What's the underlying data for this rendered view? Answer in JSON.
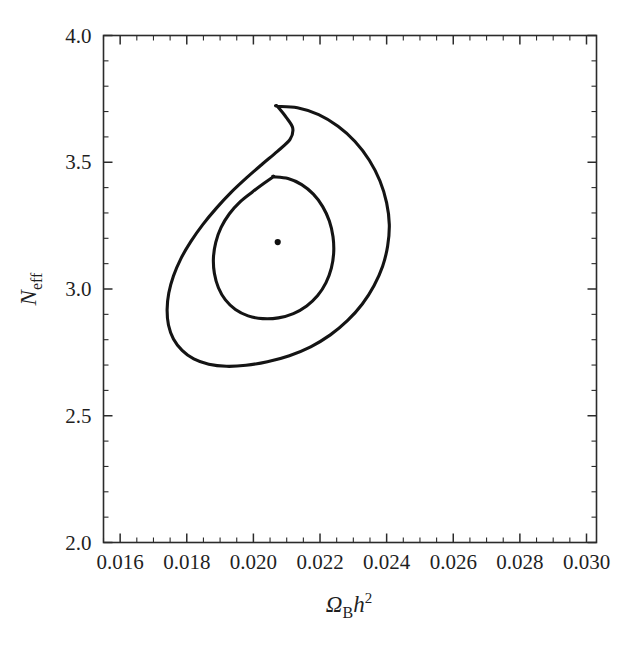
{
  "chart_data": {
    "type": "line",
    "subtype": "confidence-contour",
    "title": "",
    "subtitle": "",
    "xlabel": "Ω_B h^2",
    "xlabel_parts": {
      "omega": "Ω",
      "omega_sub": "B",
      "h": "h",
      "h_sup": "2"
    },
    "ylabel": "N_eff",
    "ylabel_parts": {
      "n": "N",
      "n_sub": "eff"
    },
    "xlim": [
      0.0155,
      0.0303
    ],
    "ylim": [
      2.0,
      4.0
    ],
    "xticks": [
      0.016,
      0.018,
      0.02,
      0.022,
      0.024,
      0.026,
      0.028,
      0.03
    ],
    "xtick_labels": [
      "0.016",
      "0.018",
      "0.020",
      "0.022",
      "0.024",
      "0.026",
      "0.028",
      "0.030"
    ],
    "xtick_minor_step": 0.0005,
    "yticks": [
      2.0,
      2.5,
      3.0,
      3.5,
      4.0
    ],
    "ytick_labels": [
      "2.0",
      "2.5",
      "3.0",
      "3.5",
      "4.0"
    ],
    "ytick_minor_step": 0.1,
    "grid": false,
    "legend": null,
    "frame": "box",
    "best_fit": {
      "x": 0.02073,
      "y": 3.185,
      "label": "best-fit point"
    },
    "series": [
      {
        "name": "outer contour",
        "closed": true,
        "points": [
          [
            0.02072,
            3.7205
          ],
          [
            0.02132,
            3.715
          ],
          [
            0.02196,
            3.688
          ],
          [
            0.02254,
            3.642
          ],
          [
            0.02305,
            3.582
          ],
          [
            0.02348,
            3.508
          ],
          [
            0.0238,
            3.426
          ],
          [
            0.024,
            3.34
          ],
          [
            0.02408,
            3.254
          ],
          [
            0.02403,
            3.17
          ],
          [
            0.02388,
            3.09
          ],
          [
            0.02362,
            3.013
          ],
          [
            0.02327,
            2.941
          ],
          [
            0.02283,
            2.876
          ],
          [
            0.02231,
            2.819
          ],
          [
            0.02172,
            2.772
          ],
          [
            0.02108,
            2.737
          ],
          [
            0.02042,
            2.713
          ],
          [
            0.01978,
            2.699
          ],
          [
            0.01919,
            2.695
          ],
          [
            0.01866,
            2.703
          ],
          [
            0.01821,
            2.724
          ],
          [
            0.01786,
            2.758
          ],
          [
            0.0176,
            2.803
          ],
          [
            0.01745,
            2.858
          ],
          [
            0.01741,
            2.919
          ],
          [
            0.01746,
            2.984
          ],
          [
            0.0176,
            3.051
          ],
          [
            0.01782,
            3.119
          ],
          [
            0.01812,
            3.187
          ],
          [
            0.01848,
            3.254
          ],
          [
            0.01889,
            3.319
          ],
          [
            0.01933,
            3.381
          ],
          [
            0.0198,
            3.439
          ],
          [
            0.02027,
            3.493
          ],
          [
            0.02072,
            3.543
          ],
          [
            0.0211,
            3.59
          ],
          [
            0.02118,
            3.635
          ],
          [
            0.02098,
            3.678
          ],
          [
            0.02072,
            3.7205
          ]
        ]
      },
      {
        "name": "inner contour",
        "closed": true,
        "points": [
          [
            0.0206,
            3.443
          ],
          [
            0.02104,
            3.436
          ],
          [
            0.02145,
            3.412
          ],
          [
            0.0218,
            3.374
          ],
          [
            0.02208,
            3.325
          ],
          [
            0.02228,
            3.268
          ],
          [
            0.02239,
            3.206
          ],
          [
            0.02241,
            3.143
          ],
          [
            0.02234,
            3.082
          ],
          [
            0.02218,
            3.025
          ],
          [
            0.02193,
            2.974
          ],
          [
            0.0216,
            2.933
          ],
          [
            0.0212,
            2.903
          ],
          [
            0.02075,
            2.886
          ],
          [
            0.02028,
            2.883
          ],
          [
            0.01984,
            2.894
          ],
          [
            0.01946,
            2.919
          ],
          [
            0.01916,
            2.957
          ],
          [
            0.01895,
            3.005
          ],
          [
            0.01883,
            3.061
          ],
          [
            0.0188,
            3.122
          ],
          [
            0.01887,
            3.184
          ],
          [
            0.01903,
            3.243
          ],
          [
            0.01928,
            3.297
          ],
          [
            0.0196,
            3.344
          ],
          [
            0.01997,
            3.383
          ],
          [
            0.02033,
            3.418
          ],
          [
            0.0206,
            3.443
          ]
        ]
      }
    ]
  },
  "figure": {
    "background_color": "#ffffff",
    "line_color": "#141414",
    "axis_color": "#2b2b2b"
  }
}
